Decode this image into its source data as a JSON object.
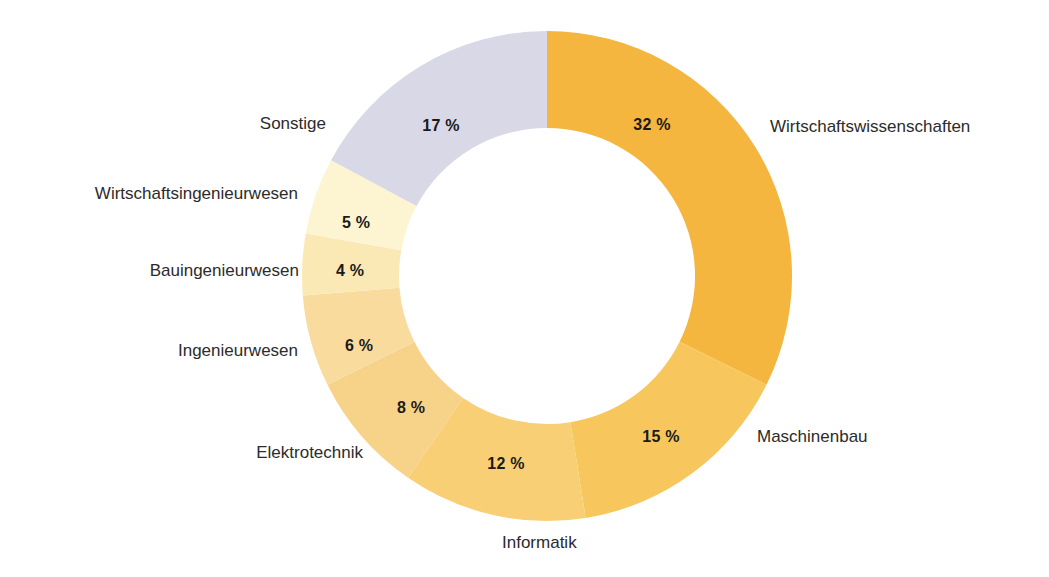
{
  "chart_data": {
    "type": "pie",
    "variant": "donut",
    "title": "",
    "subtitle": "",
    "xlabel": "",
    "ylabel": "",
    "legend_position": "outside-labels",
    "grid": false,
    "units": "%",
    "start_angle_deg": 0,
    "direction": "clockwise",
    "categories": [
      "Wirtschaftswissenschaften",
      "Maschinenbau",
      "Informatik",
      "Elektrotechnik",
      "Ingenieurwesen",
      "Bauingenieurwesen",
      "Wirtschaftsingenieurwesen",
      "Sonstige"
    ],
    "values": [
      32,
      15,
      12,
      8,
      6,
      4,
      5,
      17
    ],
    "value_labels": [
      "32 %",
      "15 %",
      "12 %",
      "8 %",
      "6 %",
      "4 %",
      "5 %",
      "17 %"
    ],
    "colors": [
      "#F4B63F",
      "#F7C75E",
      "#F8CF74",
      "#F7D289",
      "#F9DC9D",
      "#FBE9B5",
      "#FDF5D2",
      "#D8D8E6"
    ],
    "slices": [
      {
        "label": "Wirtschaftswissenschaften",
        "value": 32,
        "value_label": "32 %",
        "color": "#F4B63F",
        "label_x": 770,
        "label_y": 127,
        "label_anchor": "start",
        "pct_x": 652,
        "pct_y": 125
      },
      {
        "label": "Maschinenbau",
        "value": 15,
        "value_label": "15 %",
        "color": "#F7C75E",
        "label_x": 757,
        "label_y": 437,
        "label_anchor": "start",
        "pct_x": 661,
        "pct_y": 437
      },
      {
        "label": "Informatik",
        "value": 12,
        "value_label": "12 %",
        "color": "#F8CF74",
        "label_x": 502,
        "label_y": 543,
        "label_anchor": "start",
        "pct_x": 506,
        "pct_y": 464
      },
      {
        "label": "Elektrotechnik",
        "value": 8,
        "value_label": "8 %",
        "color": "#F7D289",
        "label_x": 363,
        "label_y": 453,
        "label_anchor": "end",
        "pct_x": 411,
        "pct_y": 408
      },
      {
        "label": "Ingenieurwesen",
        "value": 6,
        "value_label": "6 %",
        "color": "#F9DC9D",
        "label_x": 298,
        "label_y": 351,
        "label_anchor": "end",
        "pct_x": 359,
        "pct_y": 346
      },
      {
        "label": "Bauingenieurwesen",
        "value": 4,
        "value_label": "4 %",
        "color": "#FBE9B5",
        "label_x": 299,
        "label_y": 271,
        "label_anchor": "end",
        "pct_x": 350,
        "pct_y": 271
      },
      {
        "label": "Wirtschaftsingenieurwesen",
        "value": 5,
        "value_label": "5 %",
        "color": "#FDF5D2",
        "label_x": 298,
        "label_y": 194,
        "label_anchor": "end",
        "pct_x": 356,
        "pct_y": 223
      },
      {
        "label": "Sonstige",
        "value": 17,
        "value_label": "17 %",
        "color": "#D8D8E6",
        "label_x": 326,
        "label_y": 124,
        "label_anchor": "end",
        "pct_x": 441,
        "pct_y": 126
      }
    ],
    "geometry": {
      "center_x": 547,
      "center_y": 276,
      "outer_radius": 245,
      "inner_radius": 148
    }
  }
}
